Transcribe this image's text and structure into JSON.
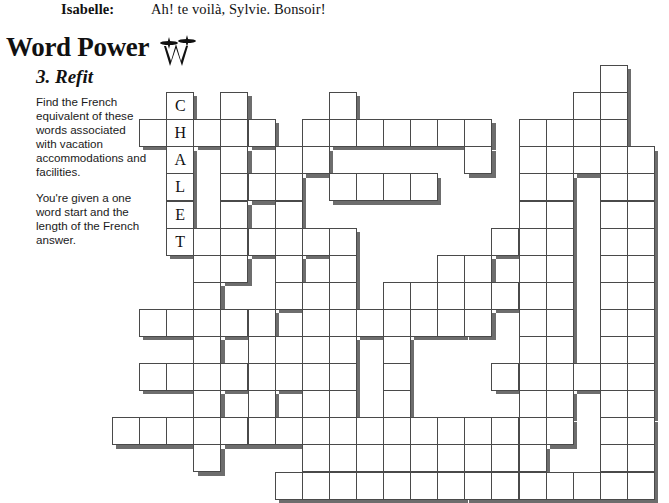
{
  "dialogue": {
    "speaker": "Isabelle:",
    "text": "Ah! te voilà, Sylvie. Bonsoir!"
  },
  "masthead": {
    "title": "Word Power",
    "logo_icon": "quill-w-logo-icon"
  },
  "puzzle": {
    "number_title": "3. Refit",
    "instructions": [
      "Find the French equivalent of these words associated with vacation accommodations and facilities.",
      "You're given a one word start and the length of the French answer."
    ],
    "seed_word": "CHALET",
    "seed_letters": [
      "C",
      "H",
      "A",
      "L",
      "E",
      "T"
    ]
  },
  "grid": {
    "columns": 20,
    "rows": 16,
    "cell_size": 27.1,
    "origin_x": 112,
    "origin_y": 65,
    "colors": {
      "cell_fill": "#ffffff",
      "cell_border": "#4a4a4a",
      "cell_shadow": "#6d6d6d",
      "letter": "#111111"
    },
    "seed_cells": [
      {
        "r": 1,
        "c": 2,
        "letter": "C"
      },
      {
        "r": 2,
        "c": 2,
        "letter": "H"
      },
      {
        "r": 3,
        "c": 2,
        "letter": "A"
      },
      {
        "r": 4,
        "c": 2,
        "letter": "L"
      },
      {
        "r": 5,
        "c": 2,
        "letter": "E"
      },
      {
        "r": 6,
        "c": 2,
        "letter": "T"
      }
    ],
    "mask": [
      "00000060006000000010",
      "00101000100000000110",
      "01111101111111011110",
      "00101011000001011111",
      "00101110111100011011",
      "00101010000000011011",
      "00111111100000111011",
      "00011010100011011011",
      "00010011101111111011",
      "01111101111111011011",
      "00010111101000011011",
      "01111111101000111111",
      "00010101101000011011",
      "11111111111111111011",
      "00010001111111110011",
      "00000011111111111111"
    ]
  }
}
